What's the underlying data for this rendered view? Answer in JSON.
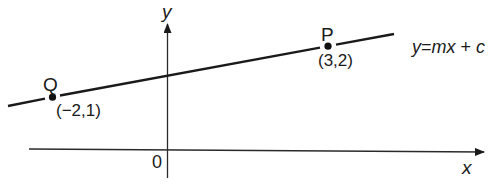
{
  "diagram": {
    "type": "coordinate-geometry",
    "axes": {
      "x_label": "x",
      "y_label": "y",
      "origin_label": "0"
    },
    "line": {
      "equation_label": "y=mx + c",
      "equation_parts": {
        "y": "y",
        "eq": "=",
        "mx": "mx",
        "plus": " + ",
        "c": "c"
      }
    },
    "points": [
      {
        "name": "Q",
        "coords_label": "(−2,1)",
        "x": -2,
        "y": 1
      },
      {
        "name": "P",
        "coords_label": "(3,2)",
        "x": 3,
        "y": 2
      }
    ],
    "colors": {
      "ink": "#1a1a1a",
      "axis": "#2a2a2a",
      "background": "#ffffff"
    }
  }
}
